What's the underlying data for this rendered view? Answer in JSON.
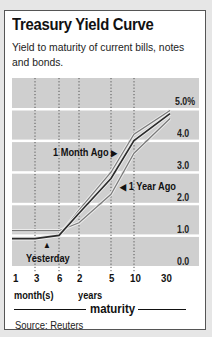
{
  "header": {
    "title": "Treasury Yield Curve",
    "subtitle": "Yield to maturity of current bills, notes and bonds."
  },
  "axis": {
    "y_ticks": [
      "5.0%",
      "4.0",
      "3.0",
      "2.0",
      "1.0",
      "0.0"
    ],
    "x_ticks": [
      "1",
      "3",
      "6",
      "2",
      "5",
      "10",
      "30"
    ],
    "x_unit_months": "month(s)",
    "x_unit_years": "years",
    "x_title": "maturity"
  },
  "annotations": {
    "month_ago": "1 Month Ago",
    "year_ago": "1 Year Ago",
    "yesterday": "Yesterday",
    "arrow_right": "▶",
    "arrow_left": "◀",
    "arrow_up": "▲"
  },
  "footer": {
    "source": "Source: Reuters"
  },
  "colors": {
    "plot_background": "#cfcfcf",
    "gridline": "#ffffff",
    "yesterday_line": "#2b2b2b",
    "other_lines": "#7a7a7a"
  },
  "chart_data": {
    "type": "line",
    "title": "Treasury Yield Curve",
    "subtitle": "Yield to maturity of current bills, notes and bonds.",
    "xlabel": "maturity",
    "ylabel": "",
    "categories": [
      "1 month",
      "3 months",
      "6 months",
      "2 years",
      "5 years",
      "10 years",
      "30 years"
    ],
    "series": [
      {
        "name": "Yesterday",
        "values": [
          0.9,
          0.9,
          1.0,
          1.7,
          2.8,
          4.0,
          4.85
        ]
      },
      {
        "name": "1 Month Ago",
        "values": [
          0.9,
          0.9,
          1.0,
          1.8,
          3.0,
          4.2,
          4.95
        ]
      },
      {
        "name": "1 Year Ago",
        "values": [
          1.15,
          1.15,
          1.15,
          1.4,
          2.3,
          3.6,
          4.7
        ]
      }
    ],
    "ylim": [
      0,
      5
    ],
    "y_tick_labels": [
      "0.0",
      "1.0",
      "2.0",
      "3.0",
      "4.0",
      "5.0%"
    ],
    "grid": "horizontal solid white, vertical dotted at ticks",
    "legend": "inline annotations with arrows",
    "source": "Source: Reuters"
  }
}
